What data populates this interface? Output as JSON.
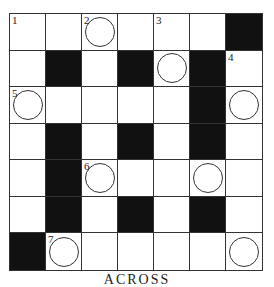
{
  "puzzle": {
    "rows": 7,
    "cols": 7,
    "grid": [
      [
        "W",
        "W",
        "W",
        "W",
        "W",
        "W",
        "B"
      ],
      [
        "W",
        "B",
        "W",
        "B",
        "W",
        "B",
        "W"
      ],
      [
        "W",
        "W",
        "W",
        "W",
        "W",
        "B",
        "W"
      ],
      [
        "W",
        "B",
        "W",
        "B",
        "W",
        "B",
        "W"
      ],
      [
        "W",
        "B",
        "W",
        "W",
        "W",
        "W",
        "W"
      ],
      [
        "W",
        "B",
        "W",
        "B",
        "W",
        "B",
        "W"
      ],
      [
        "B",
        "W",
        "W",
        "W",
        "W",
        "W",
        "W"
      ]
    ],
    "numbers": [
      {
        "row": 0,
        "col": 0,
        "label": "1"
      },
      {
        "row": 0,
        "col": 2,
        "label": "2"
      },
      {
        "row": 0,
        "col": 4,
        "label": "3"
      },
      {
        "row": 1,
        "col": 6,
        "label": "4"
      },
      {
        "row": 2,
        "col": 0,
        "label": "5"
      },
      {
        "row": 4,
        "col": 2,
        "label": "6"
      },
      {
        "row": 6,
        "col": 1,
        "label": "7"
      }
    ],
    "circles": [
      [
        0,
        2
      ],
      [
        1,
        4
      ],
      [
        2,
        0
      ],
      [
        2,
        6
      ],
      [
        4,
        2
      ],
      [
        4,
        5
      ],
      [
        6,
        1
      ],
      [
        6,
        6
      ]
    ]
  },
  "footer": {
    "heading": "ACROSS"
  }
}
